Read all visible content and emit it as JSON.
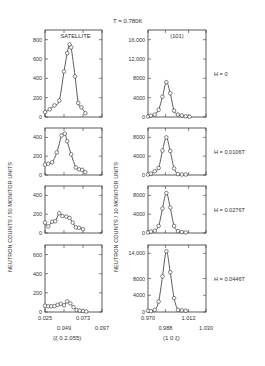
{
  "figure": {
    "temperature_label": "T = 0.780K",
    "left_ylabel": "NEUTRON COUNTS / 50 MONITOR UNITS",
    "right_ylabel": "NEUTRON COUNTS / 10 MONITOR UNITS",
    "left_xlabel": "(ξ 0 2.055)",
    "right_xlabel": "(1 0 ξ)",
    "left_title": "SATELLITE",
    "right_title": "(101)",
    "field_labels": [
      "H = 0",
      "H = 0.0106T",
      "H = 0.0276T",
      "H = 0.0446T"
    ]
  },
  "chart_data": [
    {
      "type": "scatter",
      "panel": "left-1",
      "title": "SATELLITE",
      "field": "H = 0",
      "xlim": [
        0.025,
        0.097
      ],
      "ylim": [
        0,
        900
      ],
      "yticks": [
        0,
        200,
        400,
        600,
        800
      ],
      "x": [
        0.025,
        0.031,
        0.037,
        0.043,
        0.049,
        0.053,
        0.056,
        0.058,
        0.063,
        0.067,
        0.071,
        0.076
      ],
      "y": [
        50,
        80,
        120,
        170,
        470,
        660,
        750,
        720,
        420,
        145,
        100,
        40
      ]
    },
    {
      "type": "scatter",
      "panel": "left-2",
      "field": "H = 0.0106T",
      "xlim": [
        0.025,
        0.097
      ],
      "ylim": [
        0,
        500
      ],
      "yticks": [
        0,
        200,
        400
      ],
      "x": [
        0.025,
        0.029,
        0.034,
        0.04,
        0.046,
        0.05,
        0.053,
        0.058,
        0.064,
        0.068,
        0.072,
        0.076
      ],
      "y": [
        110,
        120,
        135,
        240,
        420,
        440,
        360,
        220,
        80,
        60,
        55,
        30
      ]
    },
    {
      "type": "scatter",
      "panel": "left-3",
      "field": "H = 0.0276T",
      "xlim": [
        0.025,
        0.097
      ],
      "ylim": [
        0,
        500
      ],
      "yticks": [
        0,
        200,
        400
      ],
      "x": [
        0.025,
        0.029,
        0.034,
        0.038,
        0.043,
        0.047,
        0.052,
        0.056,
        0.06,
        0.064,
        0.068,
        0.073
      ],
      "y": [
        110,
        70,
        120,
        125,
        210,
        180,
        175,
        160,
        110,
        60,
        55,
        40
      ]
    },
    {
      "type": "scatter",
      "panel": "left-4",
      "field": "H = 0.0446T",
      "xlim": [
        0.025,
        0.097
      ],
      "ylim": [
        0,
        700
      ],
      "yticks": [
        0,
        200,
        400,
        600
      ],
      "xticks": [
        0.025,
        0.049,
        0.073,
        0.097
      ],
      "x": [
        0.025,
        0.029,
        0.033,
        0.037,
        0.041,
        0.045,
        0.049,
        0.053,
        0.057,
        0.061,
        0.065,
        0.069,
        0.073,
        0.077
      ],
      "y": [
        65,
        60,
        60,
        62,
        75,
        85,
        70,
        110,
        90,
        50,
        20,
        15,
        10,
        5
      ]
    },
    {
      "type": "scatter",
      "panel": "right-1",
      "title": "(101)",
      "field": "H = 0",
      "xlim": [
        0.97,
        1.03
      ],
      "ylim": [
        0,
        18000
      ],
      "yticks": [
        0,
        4000,
        8000,
        12000,
        16000
      ],
      "x": [
        0.97,
        0.973,
        0.977,
        0.981,
        0.985,
        0.989,
        0.993,
        0.997,
        1.001,
        1.005,
        1.009,
        1.013
      ],
      "y": [
        100,
        300,
        500,
        1500,
        4200,
        7200,
        4900,
        1300,
        500,
        300,
        150,
        50
      ]
    },
    {
      "type": "scatter",
      "panel": "right-2",
      "field": "H = 0.0106T",
      "xlim": [
        0.97,
        1.03
      ],
      "ylim": [
        0,
        10000
      ],
      "yticks": [
        0,
        4000,
        8000
      ],
      "x": [
        0.97,
        0.973,
        0.977,
        0.981,
        0.985,
        0.989,
        0.993,
        0.997,
        1.001,
        1.005,
        1.009
      ],
      "y": [
        100,
        300,
        800,
        1500,
        5200,
        8000,
        5100,
        1400,
        200,
        100,
        100
      ]
    },
    {
      "type": "scatter",
      "panel": "right-3",
      "field": "H = 0.0276T",
      "xlim": [
        0.97,
        1.03
      ],
      "ylim": [
        0,
        10000
      ],
      "yticks": [
        0,
        4000,
        8000
      ],
      "x": [
        0.97,
        0.973,
        0.977,
        0.981,
        0.985,
        0.989,
        0.993,
        0.997,
        1.001,
        1.005,
        1.009
      ],
      "y": [
        100,
        300,
        500,
        1500,
        5200,
        8500,
        5400,
        1500,
        400,
        200,
        100
      ]
    },
    {
      "type": "scatter",
      "panel": "right-4",
      "field": "H = 0.0446T",
      "xlim": [
        0.97,
        1.03
      ],
      "ylim": [
        0,
        16000
      ],
      "yticks": [
        0,
        4000,
        8000,
        14000
      ],
      "xticks": [
        0.97,
        0.988,
        1.012,
        1.03
      ],
      "x": [
        0.97,
        0.973,
        0.977,
        0.981,
        0.985,
        0.989,
        0.993,
        0.997,
        1.001,
        1.005,
        1.009
      ],
      "y": [
        300,
        200,
        500,
        2500,
        8500,
        14500,
        9500,
        3300,
        500,
        400,
        300
      ]
    }
  ]
}
